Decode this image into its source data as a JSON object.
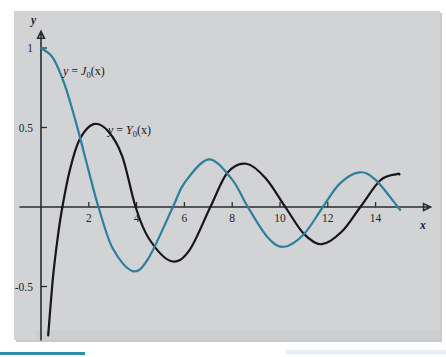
{
  "figure": {
    "background_color": "#d2d3d5",
    "page_color": "#ffffff",
    "axis_color": "#2b2b33"
  },
  "axes": {
    "x_axis_name": "x",
    "y_axis_name": "y"
  },
  "labels": {
    "j0": {
      "lhs": "y",
      "eq": " = ",
      "fn": "J",
      "sub": "0",
      "arg": "(x)",
      "full": "y = J0(x)"
    },
    "y0": {
      "lhs": "y",
      "eq": " = ",
      "fn": "Y",
      "sub": "0",
      "arg": "(x)",
      "full": "y = Y0(x)"
    }
  },
  "chart_data": {
    "type": "line",
    "title": "",
    "xlabel": "x",
    "ylabel": "y",
    "xlim": [
      -0.45,
      15.9
    ],
    "ylim": [
      -0.72,
      1.12
    ],
    "grid": false,
    "legend": "inline-curve-labels",
    "xticks": [
      2,
      4,
      6,
      8,
      10,
      12,
      14
    ],
    "xticklabels": [
      "2",
      "4",
      "6",
      "8",
      "10",
      "12",
      "14"
    ],
    "yticks": [
      1,
      0.5,
      -0.5
    ],
    "yticklabels": [
      "1",
      "0.5",
      "-0.5"
    ],
    "series": [
      {
        "name": "y = J0(x)",
        "color": "#2d7f9d",
        "label_text": "y = J0(x)",
        "x_range": [
          0,
          15
        ],
        "zeros": [
          2.405,
          5.52,
          8.654,
          11.792,
          14.931
        ],
        "extrema": [
          {
            "x": 0.0,
            "y": 1.0,
            "kind": "max"
          },
          {
            "x": 3.832,
            "y": -0.403,
            "kind": "min"
          },
          {
            "x": 7.016,
            "y": 0.3,
            "kind": "max"
          },
          {
            "x": 10.173,
            "y": -0.25,
            "kind": "min"
          },
          {
            "x": 13.324,
            "y": 0.218,
            "kind": "max"
          }
        ],
        "values": [
          {
            "x": 0.0,
            "y": 1.0
          },
          {
            "x": 0.5,
            "y": 0.938
          },
          {
            "x": 1.0,
            "y": 0.765
          },
          {
            "x": 1.5,
            "y": 0.512
          },
          {
            "x": 2.0,
            "y": 0.224
          },
          {
            "x": 2.405,
            "y": 0.0
          },
          {
            "x": 3.0,
            "y": -0.26
          },
          {
            "x": 3.832,
            "y": -0.403
          },
          {
            "x": 4.5,
            "y": -0.321
          },
          {
            "x": 5.52,
            "y": 0.0
          },
          {
            "x": 6.0,
            "y": 0.151
          },
          {
            "x": 7.016,
            "y": 0.3
          },
          {
            "x": 8.0,
            "y": 0.172
          },
          {
            "x": 8.654,
            "y": 0.0
          },
          {
            "x": 9.5,
            "y": -0.194
          },
          {
            "x": 10.173,
            "y": -0.25
          },
          {
            "x": 11.0,
            "y": -0.171
          },
          {
            "x": 11.792,
            "y": 0.0
          },
          {
            "x": 12.5,
            "y": 0.147
          },
          {
            "x": 13.324,
            "y": 0.218
          },
          {
            "x": 14.0,
            "y": 0.171
          },
          {
            "x": 14.931,
            "y": 0.0
          },
          {
            "x": 15.0,
            "y": -0.014
          }
        ]
      },
      {
        "name": "y = Y0(x)",
        "color": "#15151a",
        "label_text": "y = Y0(x)",
        "x_range": [
          0.1,
          15
        ],
        "zeros": [
          0.894,
          3.958,
          7.086,
          10.222,
          13.361
        ],
        "extrema": [
          {
            "x": 2.197,
            "y": 0.521,
            "kind": "max"
          },
          {
            "x": 5.43,
            "y": -0.34,
            "kind": "min"
          },
          {
            "x": 8.596,
            "y": 0.272,
            "kind": "max"
          },
          {
            "x": 11.749,
            "y": -0.234,
            "kind": "min"
          },
          {
            "x": 14.897,
            "y": 0.207,
            "kind": "max"
          }
        ],
        "values": [
          {
            "x": 0.1,
            "y": -1.534
          },
          {
            "x": 0.2,
            "y": -1.081
          },
          {
            "x": 0.3,
            "y": -0.807
          },
          {
            "x": 0.5,
            "y": -0.445
          },
          {
            "x": 0.7,
            "y": -0.191
          },
          {
            "x": 0.894,
            "y": 0.0
          },
          {
            "x": 1.2,
            "y": 0.228
          },
          {
            "x": 1.6,
            "y": 0.42
          },
          {
            "x": 2.197,
            "y": 0.521
          },
          {
            "x": 2.8,
            "y": 0.478
          },
          {
            "x": 3.4,
            "y": 0.319
          },
          {
            "x": 3.958,
            "y": 0.0
          },
          {
            "x": 4.5,
            "y": -0.195
          },
          {
            "x": 5.43,
            "y": -0.34
          },
          {
            "x": 6.2,
            "y": -0.274
          },
          {
            "x": 7.086,
            "y": 0.0
          },
          {
            "x": 7.8,
            "y": 0.215
          },
          {
            "x": 8.596,
            "y": 0.272
          },
          {
            "x": 9.4,
            "y": 0.181
          },
          {
            "x": 10.222,
            "y": 0.0
          },
          {
            "x": 11.0,
            "y": -0.169
          },
          {
            "x": 11.749,
            "y": -0.234
          },
          {
            "x": 12.6,
            "y": -0.153
          },
          {
            "x": 13.361,
            "y": 0.0
          },
          {
            "x": 14.2,
            "y": 0.168
          },
          {
            "x": 14.897,
            "y": 0.207
          },
          {
            "x": 15.0,
            "y": 0.205
          }
        ]
      }
    ]
  }
}
